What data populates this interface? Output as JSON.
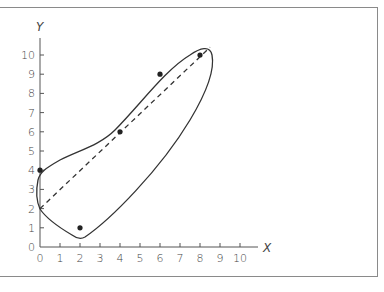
{
  "chart_data": {
    "type": "scatter",
    "title": "",
    "xlabel": "X",
    "ylabel": "Y",
    "xlim": [
      0,
      10
    ],
    "ylim": [
      0,
      10
    ],
    "x_ticks": [
      "0",
      "1",
      "2",
      "3",
      "4",
      "5",
      "6",
      "7",
      "8",
      "9",
      "10"
    ],
    "y_ticks": [
      "0",
      "1",
      "2",
      "3",
      "4",
      "5",
      "6",
      "7",
      "8",
      "9",
      "10"
    ],
    "grid": false,
    "legend": null,
    "series": [
      {
        "name": "points",
        "kind": "scatter",
        "x": [
          0,
          2,
          4,
          6,
          8
        ],
        "y": [
          4,
          1,
          6,
          9,
          10
        ]
      },
      {
        "name": "regression line",
        "kind": "dashed-line",
        "x": [
          0,
          8.5
        ],
        "y": [
          2,
          10.4
        ]
      },
      {
        "name": "confidence envelope",
        "kind": "closed-curve"
      }
    ]
  },
  "labels": {
    "x_axis": "X",
    "y_axis": "Y"
  }
}
